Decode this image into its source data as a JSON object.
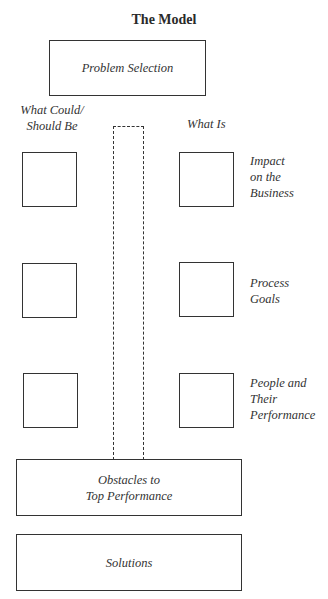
{
  "title": "The Model",
  "top_box": {
    "label": "Problem Selection"
  },
  "column_headers": {
    "left": "What Could/\nShould Be",
    "right": "What Is"
  },
  "rows": [
    {
      "label": "Impact\non the\nBusiness"
    },
    {
      "label": "Process\nGoals"
    },
    {
      "label": "People and\nTheir\nPerformance"
    }
  ],
  "bottom_boxes": [
    {
      "label": "Obstacles to\nTop Performance"
    },
    {
      "label": "Solutions"
    }
  ]
}
